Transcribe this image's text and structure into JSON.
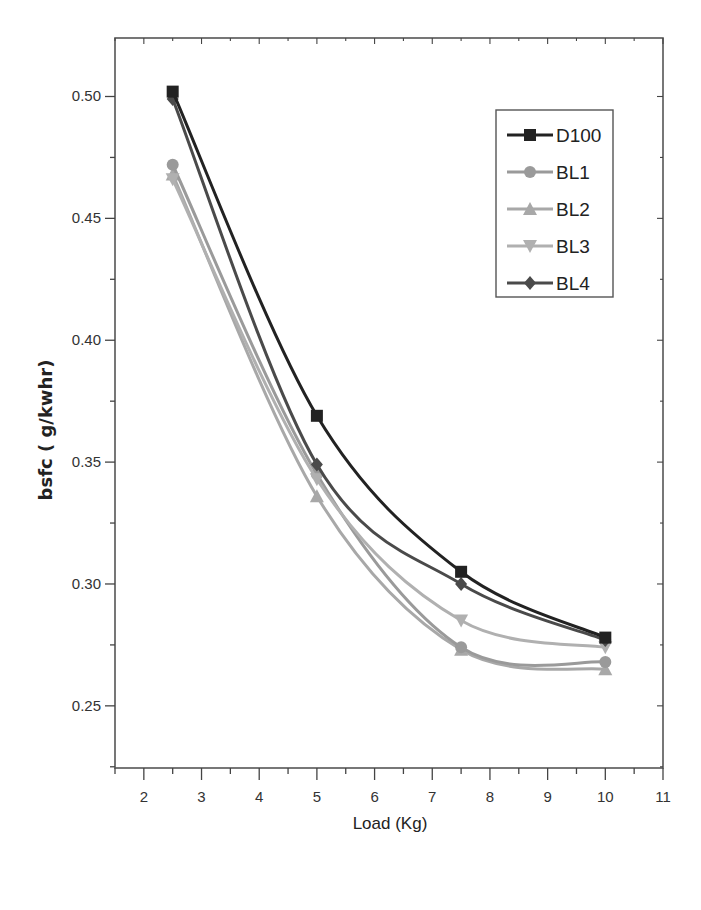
{
  "chart_data": {
    "type": "line",
    "title": "",
    "xlabel": "Load (Kg)",
    "ylabel": "bsfc (  g/kwhr)",
    "xlim": [
      1.5,
      11
    ],
    "ylim": [
      0.2245,
      0.524
    ],
    "x_ticks": [
      2,
      3,
      4,
      5,
      6,
      7,
      8,
      9,
      10,
      11
    ],
    "y_ticks": [
      "0.25",
      "0.30",
      "0.35",
      "0.40",
      "0.45",
      "0.50"
    ],
    "grid": false,
    "legend_position": "top-right",
    "x": [
      2.5,
      5,
      7.5,
      10
    ],
    "series": [
      {
        "name": "D100",
        "values": [
          0.502,
          0.369,
          0.305,
          0.278
        ],
        "color": "#222222",
        "marker": "square"
      },
      {
        "name": "BL1",
        "values": [
          0.472,
          0.345,
          0.274,
          0.268
        ],
        "color": "#9a9a9a",
        "marker": "circle"
      },
      {
        "name": "BL2",
        "values": [
          0.468,
          0.336,
          0.273,
          0.265
        ],
        "color": "#a8a8a8",
        "marker": "triangle-up"
      },
      {
        "name": "BL3",
        "values": [
          0.466,
          0.343,
          0.285,
          0.274
        ],
        "color": "#b0b0b0",
        "marker": "triangle-down"
      },
      {
        "name": "BL4",
        "values": [
          0.499,
          0.349,
          0.3,
          0.277
        ],
        "color": "#4a4a4a",
        "marker": "diamond"
      }
    ]
  }
}
